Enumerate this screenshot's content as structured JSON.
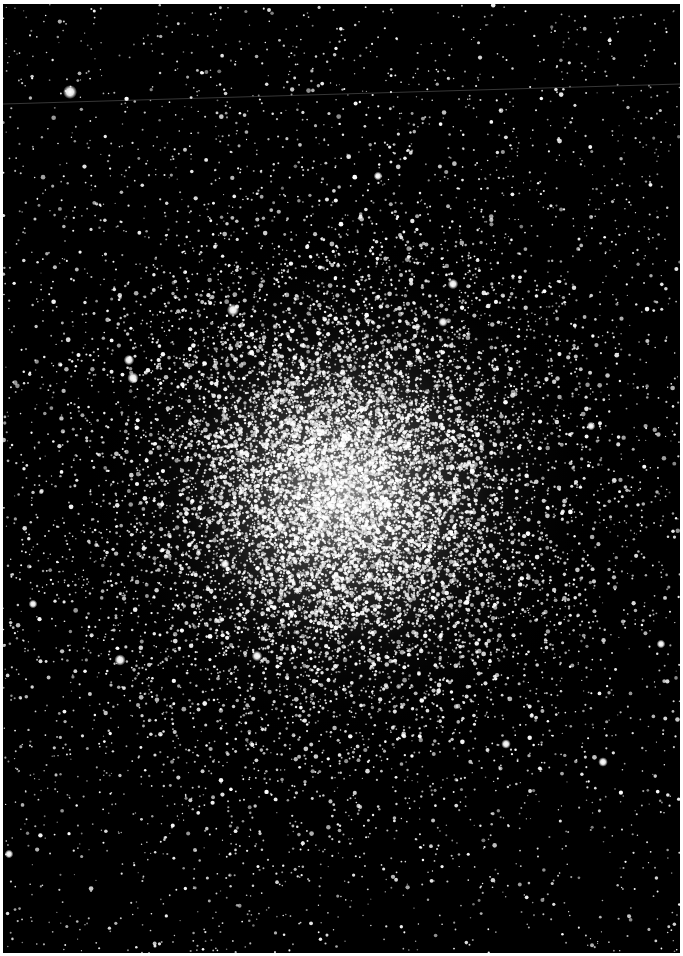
{
  "image": {
    "subject": "globular star cluster",
    "width": 683,
    "height": 956,
    "border_color": "#ffffff",
    "sky_color": "#000000",
    "star_color": "#ffffff"
  },
  "photo_area": {
    "left": 3,
    "top": 4,
    "width": 677,
    "height": 949
  },
  "cluster": {
    "core_x": 340,
    "core_y": 488,
    "core_radius": 70,
    "halo_radius": 260,
    "dense_star_count": 14000,
    "field_star_count": 2600
  },
  "satellite_trail": {
    "x1": 0,
    "y1": 100,
    "x2": 677,
    "y2": 80,
    "color": "rgba(200,200,200,0.35)"
  },
  "bright_stars": [
    {
      "x": 67,
      "y": 88,
      "r": 3.2
    },
    {
      "x": 230,
      "y": 306,
      "r": 2.8
    },
    {
      "x": 130,
      "y": 374,
      "r": 2.6
    },
    {
      "x": 126,
      "y": 356,
      "r": 2.4
    },
    {
      "x": 117,
      "y": 656,
      "r": 2.6
    },
    {
      "x": 450,
      "y": 280,
      "r": 2.4
    },
    {
      "x": 375,
      "y": 172,
      "r": 2.0
    },
    {
      "x": 600,
      "y": 758,
      "r": 2.2
    },
    {
      "x": 30,
      "y": 600,
      "r": 2.0
    },
    {
      "x": 503,
      "y": 740,
      "r": 2.2
    },
    {
      "x": 6,
      "y": 850,
      "r": 2.0
    },
    {
      "x": 254,
      "y": 652,
      "r": 2.4
    },
    {
      "x": 440,
      "y": 318,
      "r": 2.2
    },
    {
      "x": 588,
      "y": 422,
      "r": 2.0
    },
    {
      "x": 658,
      "y": 640,
      "r": 2.0
    },
    {
      "x": 222,
      "y": 560,
      "r": 2.2
    }
  ]
}
